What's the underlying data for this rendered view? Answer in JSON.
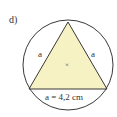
{
  "exercise_label": "d)",
  "figure": {
    "type": "equilateral triangle inscribed in circle",
    "side_labels": [
      "a",
      "a"
    ],
    "base_label": "a = 4,2 cm",
    "center_marker": "×",
    "colors": {
      "triangle_fill": "#f7f2c4",
      "stroke": "#222222"
    }
  }
}
